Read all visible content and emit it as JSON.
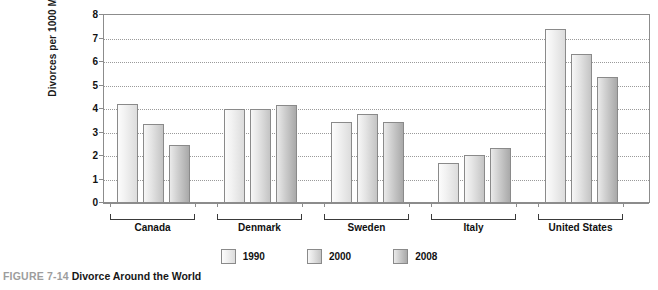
{
  "caption": {
    "figure_number": "FIGURE 7-14",
    "title": "Divorce Around the World"
  },
  "chart_data": {
    "type": "bar",
    "title": "Divorce Around the World",
    "xlabel": "",
    "ylabel": "Divorces per 1000 Marriages",
    "ylim": [
      0,
      8
    ],
    "ytick_labels": [
      "0",
      "1",
      "2",
      "3",
      "4",
      "5",
      "6",
      "7",
      "8"
    ],
    "yticks": [
      0,
      1,
      2,
      3,
      4,
      5,
      6,
      7,
      8
    ],
    "grid": "horizontal-dotted",
    "legend_position": "bottom-center",
    "categories": [
      "Canada",
      "Denmark",
      "Sweden",
      "Italy",
      "United States"
    ],
    "series": [
      {
        "name": "1990",
        "color": "#f2f2f2",
        "values": [
          4.2,
          4.0,
          3.45,
          1.7,
          7.4
        ]
      },
      {
        "name": "2000",
        "color": "#dcdcdc",
        "values": [
          3.35,
          4.0,
          3.8,
          2.05,
          6.35
        ]
      },
      {
        "name": "2008",
        "color": "#b4b4b4",
        "values": [
          2.45,
          4.15,
          3.45,
          2.35,
          5.35
        ]
      }
    ]
  }
}
